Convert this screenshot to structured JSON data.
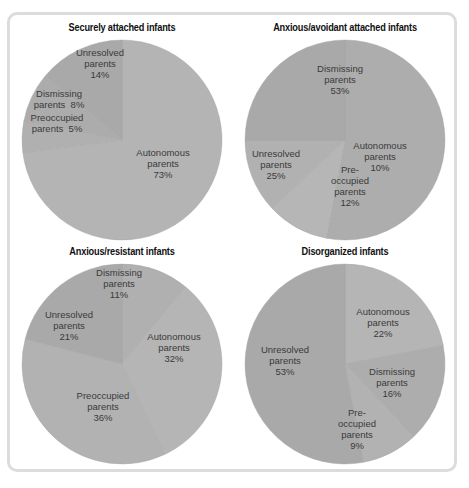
{
  "chart_data": [
    {
      "type": "pie",
      "title": "Securely attached infants",
      "start_angle_deg": 0,
      "direction": "clockwise",
      "slices": [
        {
          "label": "Autonomous parents",
          "value": 73,
          "color": "#b4b4b4"
        },
        {
          "label": "Preoccupied parents",
          "value": 5,
          "color": "#b0b0b0"
        },
        {
          "label": "Dismissing parents",
          "value": 8,
          "color": "#acacac"
        },
        {
          "label": "Unresolved parents",
          "value": 14,
          "color": "#a9a9a9"
        }
      ]
    },
    {
      "type": "pie",
      "title": "Anxious/avoidant attached infants",
      "start_angle_deg": 0,
      "direction": "clockwise",
      "slices": [
        {
          "label": "Dismissing parents",
          "value": 53,
          "color": "#adadad"
        },
        {
          "label": "Autonomous parents",
          "value": 10,
          "color": "#b6b6b6"
        },
        {
          "label": "Preoccupied parents",
          "value": 12,
          "color": "#b1b1b1"
        },
        {
          "label": "Unresolved parents",
          "value": 25,
          "color": "#a9a9a9"
        }
      ]
    },
    {
      "type": "pie",
      "title": "Anxious/resistant infants",
      "start_angle_deg": 0,
      "direction": "clockwise",
      "slices": [
        {
          "label": "Dismissing parents",
          "value": 11,
          "color": "#b0b0b0"
        },
        {
          "label": "Autonomous parents",
          "value": 32,
          "color": "#b5b5b5"
        },
        {
          "label": "Preoccupied parents",
          "value": 36,
          "color": "#b2b2b2"
        },
        {
          "label": "Unresolved parents",
          "value": 21,
          "color": "#a9a9a9"
        }
      ]
    },
    {
      "type": "pie",
      "title": "Disorganized infants",
      "start_angle_deg": 0,
      "direction": "clockwise",
      "slices": [
        {
          "label": "Autonomous parents",
          "value": 22,
          "color": "#b5b5b5"
        },
        {
          "label": "Dismissing parents",
          "value": 16,
          "color": "#adadad"
        },
        {
          "label": "Preoccupied parents",
          "value": 9,
          "color": "#b2b2b2"
        },
        {
          "label": "Unresolved parents",
          "value": 53,
          "color": "#a9a9a9"
        }
      ]
    }
  ],
  "panels": [
    {
      "title": "Securely attached infants",
      "labels": [
        {
          "text": "Unresolved\nparents\n14%",
          "x": 93,
          "y": 31
        },
        {
          "text": "Dismissing\nparents  8%",
          "x": 52,
          "y": 72
        },
        {
          "text": "Preoccupied\nparents  5%",
          "x": 50,
          "y": 96
        },
        {
          "text": "Autonomous\nparents\n73%",
          "x": 156,
          "y": 131
        }
      ]
    },
    {
      "title": "Anxious/avoidant attached infants",
      "labels": [
        {
          "text": "Dismissing\nparents\n53%",
          "x": 110,
          "y": 47
        },
        {
          "text": "Autonomous\nparents\n10%",
          "x": 150,
          "y": 124
        },
        {
          "text": "Unresolved\nparents\n25%",
          "x": 46,
          "y": 132
        },
        {
          "text": "Pre-\noccupied\nparents\n12%",
          "x": 120,
          "y": 148
        }
      ]
    },
    {
      "title": "Anxious/resistant infants",
      "labels": [
        {
          "text": "Dismissing\nparents\n11%",
          "x": 112,
          "y": 27
        },
        {
          "text": "Unresolved\nparents\n21%",
          "x": 62,
          "y": 69
        },
        {
          "text": "Autonomous\nparents\n32%",
          "x": 167,
          "y": 91
        },
        {
          "text": "Preoccupied\nparents\n36%",
          "x": 96,
          "y": 150
        }
      ]
    },
    {
      "title": "Disorganized infants",
      "labels": [
        {
          "text": "Autonomous\nparents\n22%",
          "x": 153,
          "y": 66
        },
        {
          "text": "Unresolved\nparents\n53%",
          "x": 55,
          "y": 104
        },
        {
          "text": "Dismissing\nparents\n16%",
          "x": 162,
          "y": 126
        },
        {
          "text": "Pre-\noccupied\nparents\n9%",
          "x": 127,
          "y": 167
        }
      ]
    }
  ]
}
